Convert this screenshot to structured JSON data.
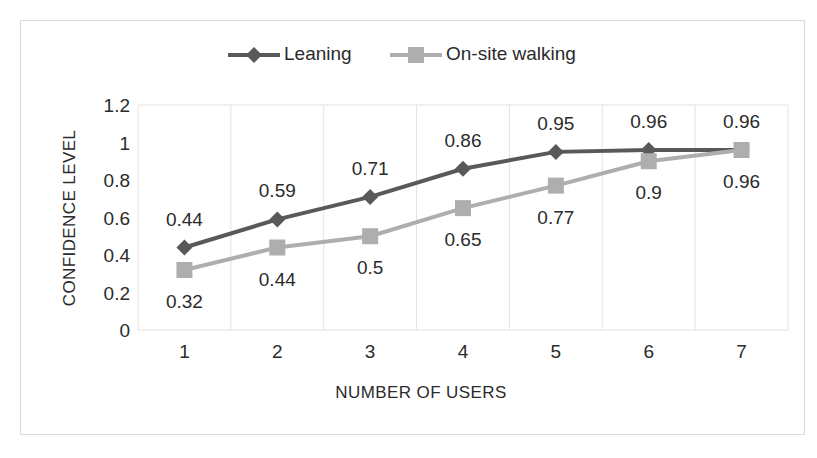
{
  "chart_data": {
    "type": "line",
    "title": "",
    "xlabel": "NUMBER OF USERS",
    "ylabel": "CONFIDENCE LEVEL",
    "x": [
      1,
      2,
      3,
      4,
      5,
      6,
      7
    ],
    "categories": [
      "1",
      "2",
      "3",
      "4",
      "5",
      "6",
      "7"
    ],
    "xtick_labels": [
      "1",
      "2",
      "3",
      "4",
      "5",
      "6",
      "7"
    ],
    "ytick_labels": [
      "0",
      "0.2",
      "0.4",
      "0.6",
      "0.8",
      "1",
      "1.2"
    ],
    "ytick_values": [
      0,
      0.2,
      0.4,
      0.6,
      0.8,
      1,
      1.2
    ],
    "ylim": [
      0,
      1.2
    ],
    "grid": "vertical-only",
    "legend_position": "top-center",
    "series": [
      {
        "name": "Leaning",
        "marker": "diamond",
        "color": "#595959",
        "values": [
          0.44,
          0.59,
          0.71,
          0.86,
          0.95,
          0.96,
          0.96
        ],
        "labels": [
          "0.44",
          "0.59",
          "0.71",
          "0.86",
          "0.95",
          "0.96",
          "0.96"
        ],
        "label_position": "above"
      },
      {
        "name": "On-site walking",
        "marker": "square",
        "color": "#aeaeae",
        "values": [
          0.32,
          0.44,
          0.5,
          0.65,
          0.77,
          0.9,
          0.96
        ],
        "labels": [
          "0.32",
          "0.44",
          "0.5",
          "0.65",
          "0.77",
          "0.9",
          "0.96"
        ],
        "label_position": "below"
      }
    ]
  },
  "legend": {
    "items": [
      {
        "label": "Leaning",
        "marker": "diamond-marker",
        "color": "#595959"
      },
      {
        "label": "On-site walking",
        "marker": "square-marker",
        "color": "#aeaeae"
      }
    ]
  },
  "axes": {
    "y_title": "CONFIDENCE LEVEL",
    "x_title": "NUMBER OF USERS",
    "y_ticks": [
      "1.2",
      "1",
      "0.8",
      "0.6",
      "0.4",
      "0.2",
      "0"
    ],
    "x_ticks": [
      "1",
      "2",
      "3",
      "4",
      "5",
      "6",
      "7"
    ]
  },
  "colors": {
    "series_leaning": "#595959",
    "series_onsite": "#aeaeae",
    "text": "#2b2b2b",
    "gridline": "#e3e3e3",
    "frame_border": "#d9d9d9",
    "background": "#ffffff"
  }
}
